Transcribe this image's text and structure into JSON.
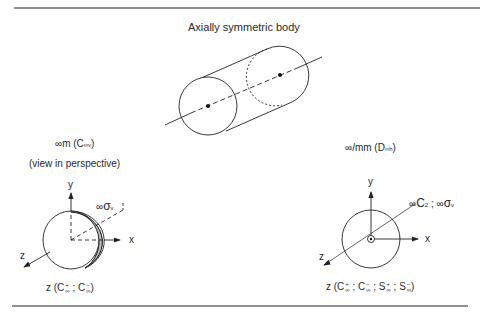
{
  "title": "Axially symmetric body",
  "left": {
    "group_prefix": "∞m (",
    "group_C": "C",
    "group_sub": "∞v",
    "group_close": ")",
    "caption": "(view in perspective)",
    "axis_y": "y",
    "axis_x": "x",
    "axis_z": "z",
    "plane_label_prefix": "∞",
    "plane_label_sigma": "σ",
    "plane_label_sub": "v",
    "bottom_z": "z (",
    "bottom_C1": "C",
    "bottom_C1_sup": "+",
    "bottom_C1_sub": "∞",
    "bottom_sep": ";",
    "bottom_C2": "C",
    "bottom_C2_sup": "−",
    "bottom_C2_sub": "∞",
    "bottom_close": ")"
  },
  "right": {
    "group_prefix": "∞/mm (",
    "group_D": "D",
    "group_sub": "∞h",
    "group_close": ")",
    "axis_y": "y",
    "axis_x": "x",
    "axis_z": "z",
    "elements_label_a": "∞",
    "elements_label_C": "C",
    "elements_label_C_sub": "2",
    "elements_label_sep": " ; ∞",
    "elements_label_sigma": "σ",
    "elements_label_sigma_sub": "v",
    "bottom_z": "z (",
    "bottom_items": [
      {
        "sym": "C",
        "sup": "+",
        "sub": "∞"
      },
      {
        "sym": "C",
        "sup": "−",
        "sub": "∞"
      },
      {
        "sym": "S",
        "sup": "+",
        "sub": "∞"
      },
      {
        "sym": "S",
        "sup": "−",
        "sub": "∞"
      }
    ],
    "bottom_sep": ";",
    "bottom_close": ")"
  }
}
